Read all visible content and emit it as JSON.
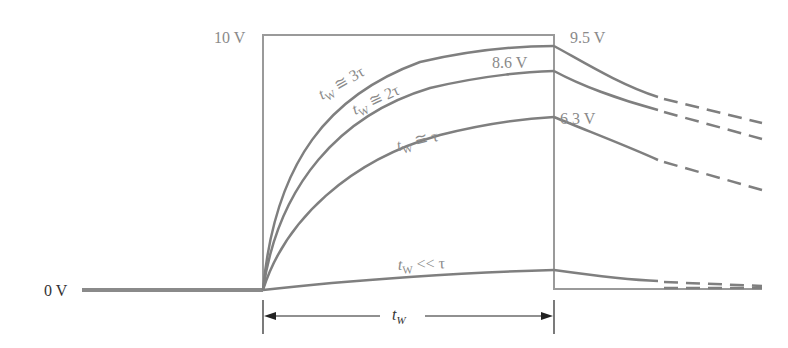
{
  "diagram": {
    "type": "rc-circuit-response",
    "colors": {
      "curve": "#7f7f7f",
      "pulse": "#9a9a9a",
      "label": "#8a8a8a",
      "dimension": "#222222",
      "background": "#ffffff"
    },
    "axis_labels": {
      "top_voltage": "10 V",
      "baseline_voltage": "0 V"
    },
    "end_values": {
      "curve_3tau": "9.5 V",
      "curve_2tau": "8.6 V",
      "curve_tau": "6.3 V"
    },
    "curves": [
      {
        "id": "3tau",
        "label_main": "t",
        "label_sub": "W",
        "label_rel": " ≅ 3τ",
        "end_value": "9.5 V"
      },
      {
        "id": "2tau",
        "label_main": "t",
        "label_sub": "W",
        "label_rel": " ≅ 2τ",
        "end_value": "8.6 V"
      },
      {
        "id": "tau",
        "label_main": "t",
        "label_sub": "W",
        "label_rel": " ≅ τ",
        "end_value": "6.3 V"
      },
      {
        "id": "lt-tau",
        "label_main": "t",
        "label_sub": "W",
        "label_rel": " << τ",
        "end_value": ""
      }
    ],
    "dimension": {
      "label_main": "t",
      "label_sub": "W"
    }
  }
}
